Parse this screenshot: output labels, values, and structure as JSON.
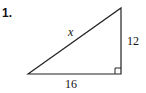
{
  "problem": {
    "number": "1.",
    "hypotenuse_label": "x",
    "vertical_leg_label": "12",
    "horizontal_leg_label": "16"
  },
  "colors": {
    "stroke": "#222222",
    "text": "#111111",
    "background": "#ffffff"
  }
}
